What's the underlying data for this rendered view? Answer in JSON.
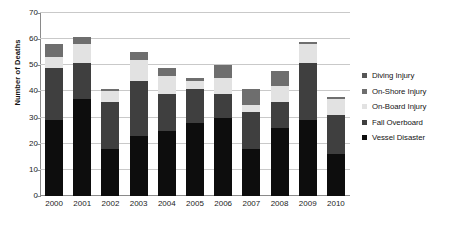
{
  "chart_data": {
    "type": "bar",
    "stacked": true,
    "title": "",
    "xlabel": "",
    "ylabel": "Number of Deaths",
    "ylim": [
      0,
      70
    ],
    "ytick_values": [
      70,
      60,
      50,
      40,
      30,
      20,
      10,
      0
    ],
    "ytick_labels": [
      "70",
      "60",
      "50",
      "40",
      "30",
      "20",
      "10",
      "0"
    ],
    "grid": true,
    "legend_position": "right",
    "categories": [
      "2000",
      "2001",
      "2002",
      "2003",
      "2004",
      "2005",
      "2006",
      "2007",
      "2008",
      "2009",
      "2010"
    ],
    "series": [
      {
        "name": "Vessel Disaster",
        "color": "#0d0d0d",
        "values": [
          29,
          37,
          18,
          23,
          25,
          28,
          30,
          18,
          26,
          29,
          16
        ]
      },
      {
        "name": "Fall Overboard",
        "color": "#3f3f3f",
        "values": [
          20,
          14,
          18,
          21,
          14,
          13,
          9,
          14,
          10,
          22,
          15
        ]
      },
      {
        "name": "On-Board Injury",
        "color": "#e2e2e2",
        "values": [
          4,
          7,
          4,
          8,
          7,
          3,
          6,
          3,
          6,
          7,
          6
        ]
      },
      {
        "name": "On-Shore Injury",
        "color": "#6e6e6e",
        "values": [
          5,
          3,
          1,
          3,
          3,
          1,
          5,
          6,
          6,
          1,
          1
        ]
      },
      {
        "name": "Diving Injury",
        "color": "#565656",
        "values": [
          0,
          0,
          0,
          0,
          0,
          0,
          0,
          0,
          0,
          0,
          0
        ]
      }
    ],
    "totals": [
      58,
      61,
      41,
      55,
      49,
      45,
      50,
      41,
      48,
      59,
      38
    ]
  },
  "legend": {
    "items": [
      {
        "label": "Diving Injury",
        "color": "#565656"
      },
      {
        "label": "On-Shore Injury",
        "color": "#6e6e6e"
      },
      {
        "label": "On-Board Injury",
        "color": "#e2e2e2"
      },
      {
        "label": "Fall Overboard",
        "color": "#3f3f3f"
      },
      {
        "label": "Vessel Disaster",
        "color": "#0d0d0d"
      }
    ]
  },
  "axes": {
    "y_title": "Number of Deaths"
  },
  "colors": {
    "gridline": "#c9c9c9",
    "axis": "#8a8a8a",
    "background": "#ffffff",
    "text": "#1d1d1d"
  }
}
